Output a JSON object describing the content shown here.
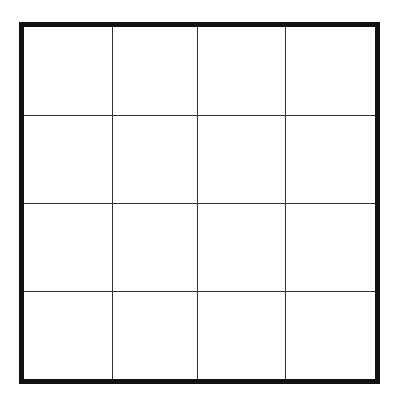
{
  "grid": {
    "rows": 4,
    "columns": 4,
    "border_color": "#111111",
    "line_color": "#333333",
    "background": "#ffffff"
  }
}
